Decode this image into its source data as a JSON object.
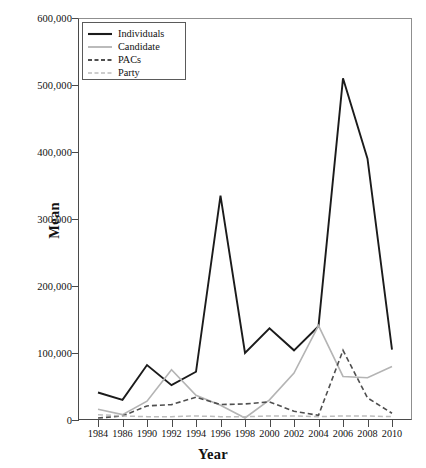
{
  "chart_data": {
    "type": "line",
    "title": "",
    "xlabel": "Year",
    "ylabel": "Mean",
    "grid": false,
    "legend_position": "top-left",
    "x": [
      1984,
      1986,
      1990,
      1992,
      1994,
      1996,
      1998,
      2000,
      2002,
      2004,
      2006,
      2008,
      2010
    ],
    "categories": [
      "1984",
      "1986",
      "1990",
      "1992",
      "1994",
      "1996",
      "1998",
      "2000",
      "2002",
      "2004",
      "2006",
      "2008",
      "2010"
    ],
    "xlim": [
      1984,
      2010
    ],
    "ylim": [
      0,
      600000
    ],
    "ytick_labels": [
      "0",
      "100,000",
      "200,000",
      "300,000",
      "400,000",
      "500,000",
      "600,000"
    ],
    "ytick_values": [
      0,
      100000,
      200000,
      300000,
      400000,
      500000,
      600000
    ],
    "series": [
      {
        "name": "Individuals",
        "color": "#1b1b1b",
        "style": "solid",
        "width": 1.9,
        "values": [
          41000,
          30000,
          82000,
          52000,
          72000,
          335000,
          100000,
          137000,
          104000,
          140000,
          510000,
          390000,
          105000
        ]
      },
      {
        "name": "Candidate",
        "color": "#b4b4b4",
        "style": "solid",
        "width": 1.6,
        "values": [
          16000,
          8000,
          28000,
          75000,
          37000,
          22000,
          3000,
          30000,
          70000,
          141000,
          65000,
          63000,
          80000
        ]
      },
      {
        "name": "PACs",
        "color": "#4f4f4f",
        "style": "dashed",
        "width": 1.6,
        "values": [
          3000,
          6000,
          21000,
          23000,
          34000,
          23000,
          24000,
          27000,
          13000,
          7000,
          104000,
          33000,
          10000
        ]
      },
      {
        "name": "Party",
        "color": "#bdbdbd",
        "style": "dashed",
        "width": 1.5,
        "values": [
          8000,
          6000,
          5000,
          5000,
          6000,
          5000,
          5000,
          6000,
          6000,
          5000,
          6000,
          6000,
          5000
        ]
      }
    ]
  },
  "legend": {
    "items": [
      {
        "label": "Individuals"
      },
      {
        "label": "Candidate"
      },
      {
        "label": "PACs"
      },
      {
        "label": "Party"
      }
    ]
  }
}
